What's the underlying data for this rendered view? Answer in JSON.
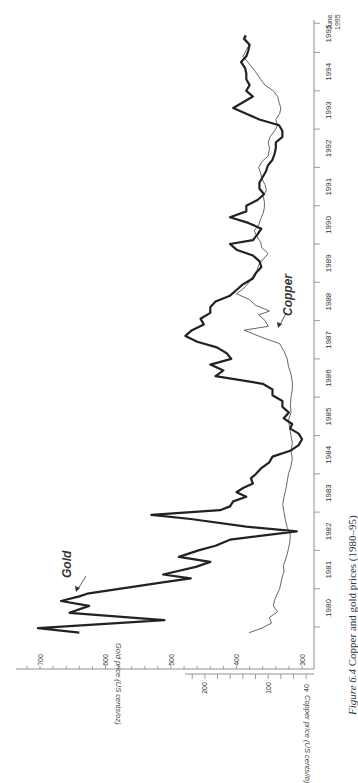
{
  "figure": {
    "caption_number": "Figure 6.4",
    "caption_text": "Copper and gold prices (1980–95)",
    "orientation": "rotated 90° counter-clockwise"
  },
  "labels": {
    "gold_series": "Gold",
    "copper_series": "Copper",
    "gold_axis_title": "Gold price (US cents/oz)",
    "copper_axis_title": "Copper price (US cents/lb)",
    "end_label_line1": "June",
    "end_label_line2": "1995"
  },
  "colors": {
    "gold_line": "#222222",
    "copper_line": "#555555",
    "axis": "#777777",
    "text": "#333333"
  },
  "chart_data": {
    "type": "line",
    "title": "Copper and gold prices (1980–95)",
    "xlabel": "Year",
    "ylabel_left": "Gold price (US cents/oz)",
    "ylabel_right": "Copper price (US cents/lb)",
    "x_ticks": [
      "1980",
      "1981",
      "1982",
      "1983",
      "1984",
      "1985",
      "1986",
      "1987",
      "1988",
      "1989",
      "1990",
      "1991",
      "1992",
      "1993",
      "1994",
      "1995",
      "June 1995"
    ],
    "gold_axis": {
      "ticks": [
        700,
        600,
        500,
        400,
        300
      ],
      "range": [
        280,
        720
      ]
    },
    "copper_axis": {
      "ticks": [
        200,
        100,
        40
      ],
      "minor_step": 20,
      "range": [
        40,
        230
      ]
    },
    "grid": false,
    "legend": "inline labels with arrows",
    "series": [
      {
        "name": "Gold",
        "unit": "US cents/oz",
        "points": [
          [
            1979.85,
            640
          ],
          [
            1979.97,
            703
          ],
          [
            1980.18,
            510
          ],
          [
            1980.37,
            655
          ],
          [
            1980.55,
            625
          ],
          [
            1980.68,
            668
          ],
          [
            1980.8,
            640
          ],
          [
            1980.87,
            628
          ],
          [
            1981.17,
            510
          ],
          [
            1981.27,
            470
          ],
          [
            1981.37,
            512
          ],
          [
            1981.57,
            462
          ],
          [
            1981.7,
            440
          ],
          [
            1981.83,
            488
          ],
          [
            1982.0,
            458
          ],
          [
            1982.12,
            432
          ],
          [
            1982.28,
            410
          ],
          [
            1982.5,
            308
          ],
          [
            1982.62,
            385
          ],
          [
            1982.82,
            470
          ],
          [
            1982.93,
            530
          ],
          [
            1983.05,
            425
          ],
          [
            1983.15,
            410
          ],
          [
            1983.28,
            405
          ],
          [
            1983.4,
            385
          ],
          [
            1983.52,
            400
          ],
          [
            1983.63,
            390
          ],
          [
            1983.75,
            375
          ],
          [
            1983.88,
            378
          ],
          [
            1984.0,
            370
          ],
          [
            1984.15,
            362
          ],
          [
            1984.3,
            350
          ],
          [
            1984.45,
            345
          ],
          [
            1984.6,
            318
          ],
          [
            1984.75,
            305
          ],
          [
            1984.9,
            300
          ],
          [
            1985.05,
            305
          ],
          [
            1985.18,
            318
          ],
          [
            1985.3,
            315
          ],
          [
            1985.45,
            328
          ],
          [
            1985.6,
            320
          ],
          [
            1985.75,
            330
          ],
          [
            1985.9,
            330
          ],
          [
            1986.05,
            345
          ],
          [
            1986.2,
            345
          ],
          [
            1986.35,
            360
          ],
          [
            1986.55,
            432
          ],
          [
            1986.7,
            420
          ],
          [
            1986.85,
            440
          ],
          [
            1987.0,
            408
          ],
          [
            1987.15,
            415
          ],
          [
            1987.3,
            430
          ],
          [
            1987.45,
            460
          ],
          [
            1987.6,
            478
          ],
          [
            1987.75,
            468
          ],
          [
            1987.9,
            450
          ],
          [
            1988.05,
            455
          ],
          [
            1988.2,
            440
          ],
          [
            1988.35,
            440
          ],
          [
            1988.5,
            432
          ],
          [
            1988.65,
            410
          ],
          [
            1988.8,
            400
          ],
          [
            1988.95,
            390
          ],
          [
            1989.1,
            375
          ],
          [
            1989.25,
            370
          ],
          [
            1989.4,
            362
          ],
          [
            1989.55,
            365
          ],
          [
            1989.7,
            375
          ],
          [
            1989.85,
            400
          ],
          [
            1990.0,
            410
          ],
          [
            1990.1,
            375
          ],
          [
            1990.25,
            368
          ],
          [
            1990.4,
            362
          ],
          [
            1990.55,
            382
          ],
          [
            1990.7,
            410
          ],
          [
            1990.85,
            385
          ],
          [
            1991.0,
            385
          ],
          [
            1991.15,
            368
          ],
          [
            1991.3,
            358
          ],
          [
            1991.45,
            365
          ],
          [
            1991.6,
            365
          ],
          [
            1991.75,
            360
          ],
          [
            1991.9,
            355
          ],
          [
            1992.05,
            352
          ],
          [
            1992.2,
            345
          ],
          [
            1992.35,
            342
          ],
          [
            1992.5,
            340
          ],
          [
            1992.65,
            340
          ],
          [
            1992.8,
            330
          ],
          [
            1992.95,
            330
          ],
          [
            1993.1,
            335
          ],
          [
            1993.25,
            365
          ],
          [
            1993.4,
            385
          ],
          [
            1993.55,
            405
          ],
          [
            1993.7,
            390
          ],
          [
            1993.85,
            375
          ],
          [
            1994.0,
            385
          ],
          [
            1994.15,
            380
          ],
          [
            1994.3,
            385
          ],
          [
            1994.45,
            385
          ],
          [
            1994.6,
            387
          ],
          [
            1994.75,
            393
          ],
          [
            1994.9,
            385
          ],
          [
            1995.05,
            382
          ],
          [
            1995.2,
            380
          ],
          [
            1995.35,
            388
          ],
          [
            1995.45,
            386
          ]
        ]
      },
      {
        "name": "Copper",
        "unit": "US cents/lb",
        "points": [
          [
            1979.85,
            130
          ],
          [
            1979.97,
            110
          ],
          [
            1980.1,
            95
          ],
          [
            1980.25,
            98
          ],
          [
            1980.4,
            85
          ],
          [
            1980.55,
            92
          ],
          [
            1980.7,
            90
          ],
          [
            1980.85,
            86
          ],
          [
            1981.0,
            82
          ],
          [
            1981.15,
            80
          ],
          [
            1981.3,
            78
          ],
          [
            1981.45,
            75
          ],
          [
            1981.6,
            76
          ],
          [
            1981.75,
            73
          ],
          [
            1981.9,
            70
          ],
          [
            1982.05,
            68
          ],
          [
            1982.2,
            66
          ],
          [
            1982.4,
            65
          ],
          [
            1982.6,
            70
          ],
          [
            1982.8,
            73
          ],
          [
            1983.0,
            75
          ],
          [
            1983.2,
            77
          ],
          [
            1983.4,
            75
          ],
          [
            1983.6,
            72
          ],
          [
            1983.8,
            70
          ],
          [
            1984.0,
            68
          ],
          [
            1984.2,
            64
          ],
          [
            1984.4,
            62
          ],
          [
            1984.6,
            64
          ],
          [
            1984.8,
            62
          ],
          [
            1985.0,
            64
          ],
          [
            1985.2,
            66
          ],
          [
            1985.4,
            68
          ],
          [
            1985.6,
            64
          ],
          [
            1985.8,
            65
          ],
          [
            1986.0,
            64
          ],
          [
            1986.2,
            62
          ],
          [
            1986.4,
            62
          ],
          [
            1986.6,
            64
          ],
          [
            1986.8,
            68
          ],
          [
            1987.0,
            70
          ],
          [
            1987.2,
            75
          ],
          [
            1987.4,
            82
          ],
          [
            1987.55,
            108
          ],
          [
            1987.75,
            138
          ],
          [
            1987.85,
            100
          ],
          [
            1988.0,
            105
          ],
          [
            1988.15,
            115
          ],
          [
            1988.25,
            98
          ],
          [
            1988.4,
            120
          ],
          [
            1988.55,
            130
          ],
          [
            1988.7,
            150
          ],
          [
            1988.85,
            138
          ],
          [
            1989.0,
            130
          ],
          [
            1989.15,
            125
          ],
          [
            1989.3,
            118
          ],
          [
            1989.45,
            115
          ],
          [
            1989.6,
            108
          ],
          [
            1989.75,
            100
          ],
          [
            1989.9,
            110
          ],
          [
            1990.05,
            112
          ],
          [
            1990.2,
            118
          ],
          [
            1990.35,
            122
          ],
          [
            1990.5,
            115
          ],
          [
            1990.65,
            112
          ],
          [
            1990.8,
            108
          ],
          [
            1990.95,
            106
          ],
          [
            1991.1,
            106
          ],
          [
            1991.25,
            108
          ],
          [
            1991.4,
            103
          ],
          [
            1991.55,
            105
          ],
          [
            1991.7,
            110
          ],
          [
            1991.85,
            112
          ],
          [
            1992.0,
            115
          ],
          [
            1992.15,
            110
          ],
          [
            1992.3,
            100
          ],
          [
            1992.5,
            98
          ],
          [
            1992.65,
            100
          ],
          [
            1992.8,
            97
          ],
          [
            1992.95,
            90
          ],
          [
            1993.1,
            85
          ],
          [
            1993.25,
            88
          ],
          [
            1993.4,
            82
          ],
          [
            1993.55,
            80
          ],
          [
            1993.7,
            83
          ],
          [
            1993.85,
            85
          ],
          [
            1994.0,
            92
          ],
          [
            1994.15,
            105
          ],
          [
            1994.3,
            112
          ],
          [
            1994.45,
            118
          ],
          [
            1994.6,
            125
          ],
          [
            1994.75,
            132
          ],
          [
            1994.9,
            140
          ],
          [
            1995.05,
            135
          ],
          [
            1995.2,
            130
          ],
          [
            1995.35,
            140
          ],
          [
            1995.45,
            137
          ]
        ]
      }
    ]
  }
}
